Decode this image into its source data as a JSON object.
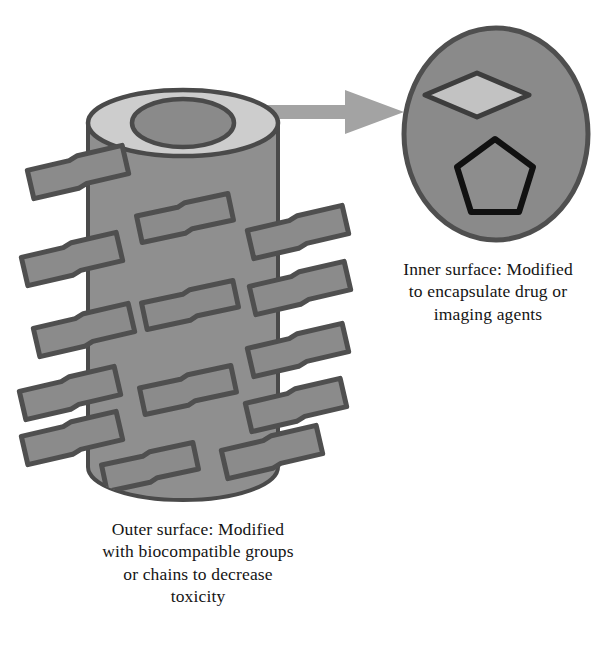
{
  "figure": {
    "kind": "scientific-schematic",
    "background_color": "#ffffff"
  },
  "palette": {
    "body_gray": "#8f8f8f",
    "top_rim_light_gray": "#cdcdcd",
    "bore_gray": "#8a8a8a",
    "outline_dark": "#4a4a4a",
    "chain_fill": "#8b8b8b",
    "chain_outline": "#4f4f4f",
    "arrow_gray": "#a3a3a3",
    "ellipse_fill": "#8a8a8a",
    "ellipse_outline": "#4f4f4f",
    "diamond_fill": "#c2c2c2",
    "diamond_outline": "#3d3d3d",
    "pentagon_fill": "#8d8d8d",
    "pentagon_outline": "#111111",
    "text_color": "#141414"
  },
  "objects": {
    "cylinder": {
      "name": "nanotube",
      "left": 88,
      "right": 278,
      "top": 90,
      "bottom": 500,
      "top_ellipse_ry": 33,
      "bore_rx": 51,
      "bore_ry": 24,
      "chain_count_left": 5,
      "chain_count_middle": 4,
      "chain_count_right": 5
    },
    "arrow": {
      "name": "magnification-arrow",
      "from_x": 248,
      "to_x": 404,
      "y": 112,
      "shaft_thickness": 15,
      "style": "block-arrow"
    },
    "cross_section": {
      "name": "nanotube-cross-section",
      "cx": 496,
      "cy": 134,
      "rx": 92,
      "ry": 106,
      "inclusions": [
        {
          "shape": "diamond",
          "label": "drug-molecule",
          "cx": 477,
          "cy": 95,
          "half_w": 52,
          "half_h": 22
        },
        {
          "shape": "pentagon",
          "label": "imaging-agent",
          "cx": 495,
          "cy": 179,
          "radius": 40
        }
      ]
    }
  },
  "captions": {
    "inner": {
      "id": "inner-surface-caption",
      "lines": [
        "Inner surface: Modified",
        "to encapsulate drug or",
        "imaging agents"
      ],
      "text": "Inner surface: Modified\nto encapsulate drug or\nimaging agents"
    },
    "outer": {
      "id": "outer-surface-caption",
      "lines": [
        "Outer surface: Modified",
        "with biocompatible groups",
        "or chains to decrease",
        "toxicity"
      ],
      "text": "Outer surface: Modified\nwith biocompatible groups\nor chains to decrease\ntoxicity"
    }
  }
}
